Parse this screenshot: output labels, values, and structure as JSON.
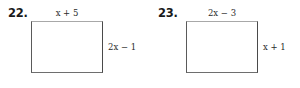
{
  "page": {
    "type": "textbook-exercise-figures",
    "background_color": "#ffffff",
    "text_color": "#2b2b2b",
    "stroke_color": "#5a5a5a"
  },
  "problems": [
    {
      "number": "22.",
      "shape": "rectangle",
      "top_label": "x + 5",
      "right_label": "2x − 1"
    },
    {
      "number": "23.",
      "shape": "rectangle",
      "top_label": "2x − 3",
      "right_label": "x + 1"
    }
  ]
}
